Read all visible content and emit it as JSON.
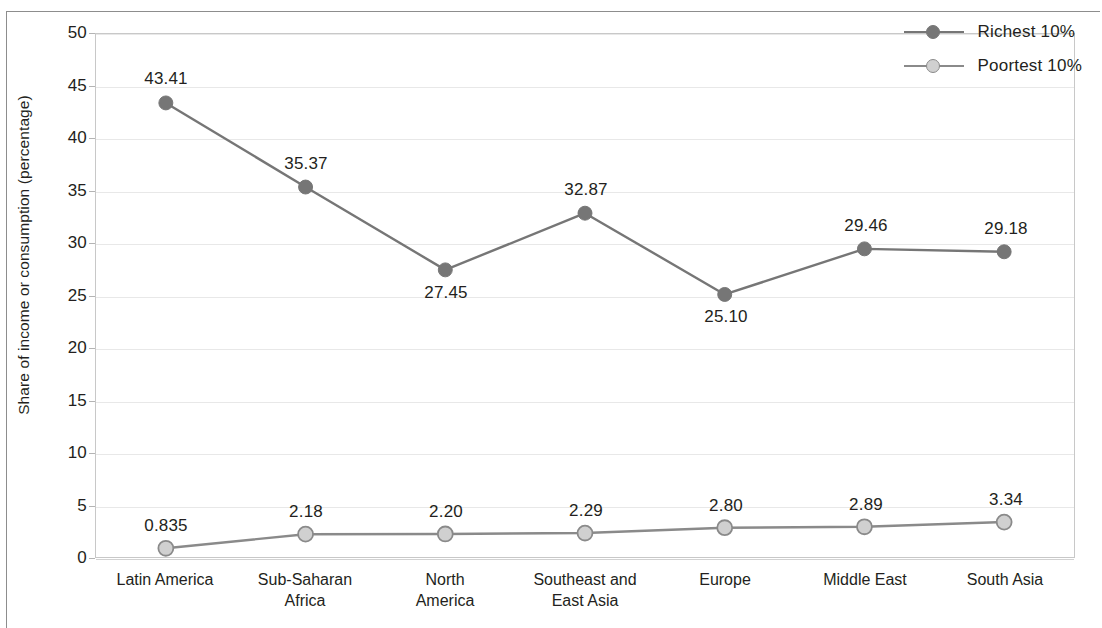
{
  "chart_data": {
    "type": "line",
    "title": "",
    "xlabel": "",
    "ylabel": "Share of income or consumption (percentage)",
    "ylim": [
      0,
      50
    ],
    "ytick_step": 5,
    "yticks": [
      "0",
      "5",
      "10",
      "15",
      "20",
      "25",
      "30",
      "35",
      "40",
      "45",
      "50"
    ],
    "grid": true,
    "legend_position": "top-right",
    "categories": [
      "Latin America",
      "Sub-Saharan Africa",
      "North America",
      "Southeast and East Asia",
      "Europe",
      "Middle East",
      "South Asia"
    ],
    "category_lines": [
      [
        "Latin America"
      ],
      [
        "Sub-Saharan",
        "Africa"
      ],
      [
        "North",
        "America"
      ],
      [
        "Southeast and",
        "East Asia"
      ],
      [
        "Europe"
      ],
      [
        "Middle East"
      ],
      [
        "South Asia"
      ]
    ],
    "series": [
      {
        "name": "Richest 10%",
        "values": [
          43.41,
          35.37,
          27.45,
          32.87,
          25.1,
          29.46,
          29.18
        ],
        "labels": [
          "43.41",
          "35.37",
          "27.45",
          "32.87",
          "25.10",
          "29.46",
          "29.18"
        ],
        "label_position": [
          "above",
          "above",
          "below",
          "above",
          "below",
          "above",
          "above"
        ],
        "color": "#767676",
        "marker_fill": "#767676",
        "marker_stroke": "#767676"
      },
      {
        "name": "Poortest 10%",
        "values": [
          0.835,
          2.18,
          2.2,
          2.29,
          2.8,
          2.89,
          3.34
        ],
        "labels": [
          "0.835",
          "2.18",
          "2.20",
          "2.29",
          "2.80",
          "2.89",
          "3.34"
        ],
        "label_position": [
          "above",
          "above",
          "above",
          "above",
          "above",
          "above",
          "above"
        ],
        "color": "#8a8a8a",
        "marker_fill": "#d0d0d0",
        "marker_stroke": "#8a8a8a"
      }
    ]
  },
  "legend": {
    "items": [
      {
        "label": "Richest 10%",
        "marker_fill": "#767676",
        "marker_stroke": "#767676",
        "line_color": "#767676"
      },
      {
        "label": "Poortest 10%",
        "marker_fill": "#d0d0d0",
        "marker_stroke": "#8a8a8a",
        "line_color": "#8a8a8a"
      }
    ]
  },
  "axis": {
    "y_title": "Share of income or consumption (percentage)"
  },
  "colors": {
    "gridline": "#e8e8e8",
    "plot_border": "#c8c8c8",
    "frame": "#8d8d8d",
    "text": "#231f20"
  }
}
